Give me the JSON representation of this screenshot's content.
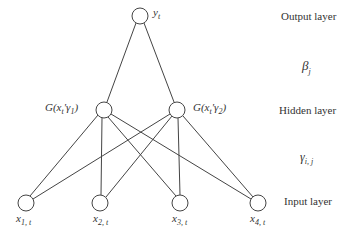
{
  "diagram": {
    "type": "neural-network",
    "nodes": {
      "output": [
        {
          "id": "y",
          "label": "y_t",
          "x": 140,
          "y": 16
        }
      ],
      "hidden": [
        {
          "id": "h1",
          "label": "G(x_t' γ_1)",
          "x": 104,
          "y": 110
        },
        {
          "id": "h2",
          "label": "G(x_t' γ_2)",
          "x": 177,
          "y": 110
        }
      ],
      "input": [
        {
          "id": "x1",
          "label": "x_{1,t}",
          "x": 26,
          "y": 203
        },
        {
          "id": "x2",
          "label": "x_{2,t}",
          "x": 100,
          "y": 203
        },
        {
          "id": "x3",
          "label": "x_{3,t}",
          "x": 180,
          "y": 203
        },
        {
          "id": "x4",
          "label": "x_{4,t}",
          "x": 258,
          "y": 203
        }
      ]
    },
    "edges": "fully connected input→hidden, hidden→output"
  },
  "labels": {
    "output_node": {
      "base": "y",
      "sub": "t"
    },
    "hidden1": {
      "pre": "G(x",
      "sub1": "t",
      "prime": "'",
      "gamma": "γ",
      "sub2": "1",
      "post": ")"
    },
    "hidden2": {
      "pre": "G(x",
      "sub1": "t",
      "prime": "'",
      "gamma": "γ",
      "sub2": "2",
      "post": ")"
    },
    "input1": {
      "base": "x",
      "sub": "1, t"
    },
    "input2": {
      "base": "x",
      "sub": "2, t"
    },
    "input3": {
      "base": "x",
      "sub": "3, t"
    },
    "input4": {
      "base": "x",
      "sub": "4, t"
    }
  },
  "layers": {
    "output": "Output layer",
    "beta": {
      "base": "β",
      "sub": "j"
    },
    "hidden": "Hidden layer",
    "gamma": {
      "base": "γ",
      "sub": "i, j"
    },
    "input": "Input layer"
  }
}
